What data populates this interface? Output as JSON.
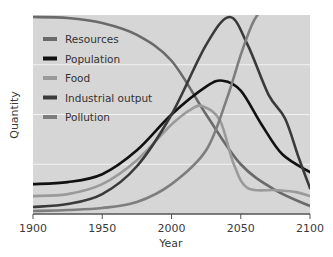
{
  "chart_data": {
    "type": "line",
    "title": "",
    "xlabel": "Year",
    "ylabel": "Quantity",
    "xlim": [
      1900,
      2100
    ],
    "ylim": [
      0,
      100
    ],
    "x_ticks": [
      1900,
      1950,
      2000,
      2050,
      2100
    ],
    "x_tick_labels": [
      "1900",
      "1950",
      "2000",
      "2050",
      "2100"
    ],
    "y_gridlines": [
      25,
      50,
      75
    ],
    "grid": true,
    "legend_position": "top-left",
    "background_color": "#d6d6d6",
    "series": [
      {
        "name": "Resources",
        "color": "#6a6a6a",
        "x": [
          1900,
          1925,
          1950,
          1975,
          2000,
          2025,
          2050,
          2075,
          2100
        ],
        "values": [
          99,
          98.5,
          96,
          90,
          77,
          50,
          25,
          12,
          4
        ]
      },
      {
        "name": "Population",
        "color": "#111111",
        "x": [
          1900,
          1925,
          1950,
          1975,
          2000,
          2025,
          2037,
          2050,
          2065,
          2080,
          2100
        ],
        "values": [
          15,
          16,
          20,
          32,
          50,
          64,
          67,
          62,
          45,
          30,
          21
        ]
      },
      {
        "name": "Food",
        "color": "#9a9a9a",
        "x": [
          1900,
          1925,
          1950,
          1975,
          2000,
          2015,
          2023,
          2035,
          2045,
          2055,
          2075,
          2090,
          2100
        ],
        "values": [
          9,
          10,
          15,
          27,
          45,
          53,
          54,
          47,
          25,
          13,
          12,
          11,
          9
        ]
      },
      {
        "name": "Industrial output",
        "color": "#3a3a3a",
        "x": [
          1900,
          1925,
          1950,
          1975,
          2000,
          2025,
          2042,
          2055,
          2070,
          2082,
          2092,
          2100
        ],
        "values": [
          3.5,
          5,
          10,
          24,
          50,
          85,
          99,
          85,
          60,
          48,
          28,
          13
        ]
      },
      {
        "name": "Pollution",
        "color": "#7e7e7e",
        "x": [
          1900,
          1925,
          1950,
          1975,
          2000,
          2025,
          2040,
          2050,
          2058,
          2063
        ],
        "values": [
          1.5,
          2,
          3,
          6,
          15,
          32,
          58,
          80,
          95,
          101
        ]
      }
    ]
  }
}
